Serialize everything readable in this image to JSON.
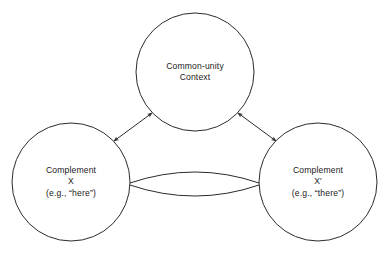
{
  "diagram": {
    "type": "triangle-node-diagram",
    "background_color": "#ffffff",
    "stroke_color": "#2b2b2b",
    "nodes": [
      {
        "id": "context",
        "name": "common-unity-context",
        "center_x": 195,
        "center_y": 72,
        "radius": 59,
        "lines": [
          "Common-unity",
          "Context"
        ]
      },
      {
        "id": "complement-x",
        "name": "complement-x",
        "center_x": 71,
        "center_y": 182,
        "radius": 59,
        "lines": [
          "Complement",
          "X",
          "(e.g., “here”)"
        ]
      },
      {
        "id": "complement-x-prime",
        "name": "complement-x-prime",
        "center_x": 318,
        "center_y": 182,
        "radius": 59,
        "lines": [
          "Complement",
          "X′",
          "(e.g., “there”)"
        ]
      }
    ],
    "connectors": [
      {
        "id": "left-to-context",
        "from": "complement-x",
        "to": "context",
        "style": "double-arrow"
      },
      {
        "id": "right-to-context",
        "from": "complement-x-prime",
        "to": "context",
        "style": "double-arrow"
      },
      {
        "id": "left-to-right-lens",
        "from": "complement-x",
        "to": "complement-x-prime",
        "style": "double-arc-lens"
      }
    ]
  }
}
